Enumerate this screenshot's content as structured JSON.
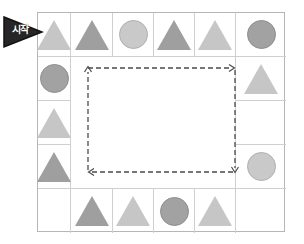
{
  "figure": {
    "name": "board-game-cycle-diagram",
    "start_label": "시작",
    "start_icon": "right-arrow-marker",
    "grid": {
      "columns": 6,
      "rows": 5
    },
    "colors": {
      "shape_light": "#c6c6c6",
      "shape_dark": "#9f9f9f",
      "grid_line": "#cfcfcf",
      "border": "#b6b6b6",
      "path": "#4a4a4a",
      "marker_fill": "#262626",
      "background": "#ffffff"
    },
    "path": {
      "style": "dashed",
      "direction": "clockwise-loop",
      "arrowheads": [
        "up-left",
        "right-top",
        "down-right",
        "left-bottom"
      ]
    },
    "cells": [
      {
        "row": 1,
        "col": 1,
        "shape": "triangle",
        "tone": "light"
      },
      {
        "row": 1,
        "col": 2,
        "shape": "triangle",
        "tone": "dark"
      },
      {
        "row": 1,
        "col": 3,
        "shape": "circle",
        "tone": "light"
      },
      {
        "row": 1,
        "col": 4,
        "shape": "triangle",
        "tone": "dark"
      },
      {
        "row": 1,
        "col": 5,
        "shape": "triangle",
        "tone": "light"
      },
      {
        "row": 1,
        "col": 6,
        "shape": "circle",
        "tone": "dark"
      },
      {
        "row": 2,
        "col": 1,
        "shape": "circle",
        "tone": "dark"
      },
      {
        "row": 2,
        "col": 2,
        "shape": "none",
        "tone": "none"
      },
      {
        "row": 2,
        "col": 3,
        "shape": "none",
        "tone": "none"
      },
      {
        "row": 2,
        "col": 4,
        "shape": "none",
        "tone": "none"
      },
      {
        "row": 2,
        "col": 5,
        "shape": "none",
        "tone": "none"
      },
      {
        "row": 2,
        "col": 6,
        "shape": "triangle",
        "tone": "light"
      },
      {
        "row": 3,
        "col": 1,
        "shape": "triangle",
        "tone": "light"
      },
      {
        "row": 3,
        "col": 2,
        "shape": "none",
        "tone": "none"
      },
      {
        "row": 3,
        "col": 3,
        "shape": "none",
        "tone": "none"
      },
      {
        "row": 3,
        "col": 4,
        "shape": "none",
        "tone": "none"
      },
      {
        "row": 3,
        "col": 5,
        "shape": "none",
        "tone": "none"
      },
      {
        "row": 3,
        "col": 6,
        "shape": "none",
        "tone": "none"
      },
      {
        "row": 4,
        "col": 1,
        "shape": "triangle",
        "tone": "dark"
      },
      {
        "row": 4,
        "col": 2,
        "shape": "none",
        "tone": "none"
      },
      {
        "row": 4,
        "col": 3,
        "shape": "none",
        "tone": "none"
      },
      {
        "row": 4,
        "col": 4,
        "shape": "none",
        "tone": "none"
      },
      {
        "row": 4,
        "col": 5,
        "shape": "none",
        "tone": "none"
      },
      {
        "row": 4,
        "col": 6,
        "shape": "circle",
        "tone": "light"
      },
      {
        "row": 5,
        "col": 1,
        "shape": "none",
        "tone": "none"
      },
      {
        "row": 5,
        "col": 2,
        "shape": "triangle",
        "tone": "dark"
      },
      {
        "row": 5,
        "col": 3,
        "shape": "triangle",
        "tone": "light"
      },
      {
        "row": 5,
        "col": 4,
        "shape": "circle",
        "tone": "dark"
      },
      {
        "row": 5,
        "col": 5,
        "shape": "triangle",
        "tone": "light"
      },
      {
        "row": 5,
        "col": 6,
        "shape": "none",
        "tone": "none"
      }
    ]
  }
}
